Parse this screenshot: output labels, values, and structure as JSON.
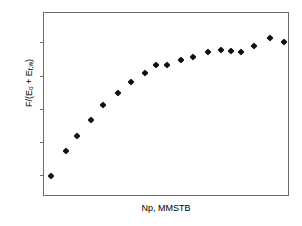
{
  "chart_data": {
    "type": "scatter",
    "title": "",
    "xlabel": "Np, MMSTB",
    "ylabel": "F/(E_o + E_f,w)",
    "ylabel_parts": {
      "prefix": "F/(E",
      "sub1": "o",
      "middle": " + E",
      "sub2": "f,w",
      "suffix": ")"
    },
    "grid": false,
    "legend": null,
    "xticklabels": [],
    "yticklabels": [],
    "x_tick_count": 0,
    "y_tick_count": 5,
    "y_tick_fracs": [
      0.12,
      0.3,
      0.48,
      0.66,
      0.84
    ],
    "xlim": [
      0,
      1
    ],
    "ylim": [
      0,
      1
    ],
    "axis_note": "Axes are unlabeled; tick values not shown in figure",
    "points": [
      {
        "x": 0.03,
        "y": 0.115
      },
      {
        "x": 0.09,
        "y": 0.25
      },
      {
        "x": 0.135,
        "y": 0.33
      },
      {
        "x": 0.19,
        "y": 0.42
      },
      {
        "x": 0.24,
        "y": 0.5
      },
      {
        "x": 0.3,
        "y": 0.565
      },
      {
        "x": 0.355,
        "y": 0.625
      },
      {
        "x": 0.41,
        "y": 0.675
      },
      {
        "x": 0.455,
        "y": 0.715
      },
      {
        "x": 0.5,
        "y": 0.715
      },
      {
        "x": 0.555,
        "y": 0.745
      },
      {
        "x": 0.605,
        "y": 0.76
      },
      {
        "x": 0.665,
        "y": 0.79
      },
      {
        "x": 0.72,
        "y": 0.8
      },
      {
        "x": 0.76,
        "y": 0.795
      },
      {
        "x": 0.8,
        "y": 0.788
      },
      {
        "x": 0.855,
        "y": 0.82
      },
      {
        "x": 0.92,
        "y": 0.865
      },
      {
        "x": 0.975,
        "y": 0.845
      }
    ],
    "marker": {
      "shape": "diamond",
      "color": "#101010",
      "size": 5
    },
    "frame_color": "#6b6b6b"
  }
}
